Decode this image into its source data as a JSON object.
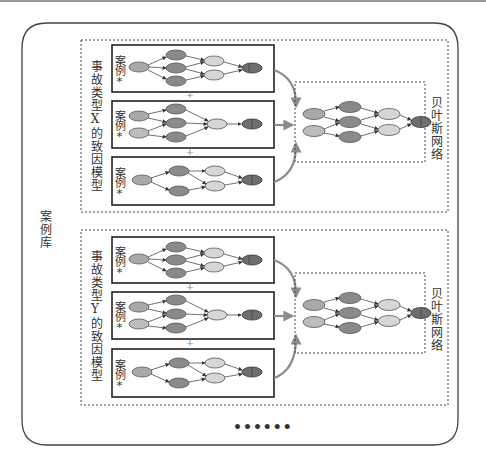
{
  "diagram": {
    "library_label": "案例库",
    "ellipsis": "••••••",
    "groups": [
      {
        "id": "X",
        "cause_model_label": "事故类型X的致因模型",
        "case_label": "案例*",
        "case_count": 3,
        "separator": "+",
        "bayes_label": "贝叶斯网络"
      },
      {
        "id": "Y",
        "cause_model_label": "事故类型Y的致因模型",
        "case_label": "案例*",
        "case_count": 3,
        "separator": "+",
        "bayes_label": "贝叶斯网络"
      }
    ]
  },
  "colors": {
    "node_dark": "#8a8a8a",
    "node_mid": "#a9a9a9",
    "node_light": "#d6d6d6",
    "node_output": "#6e6e6e",
    "arrow_gray": "#8c8c8c",
    "border": "#333333"
  }
}
